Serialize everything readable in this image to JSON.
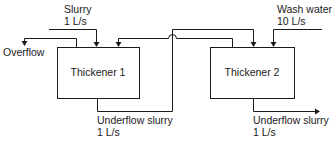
{
  "diagram": {
    "units": [
      {
        "id": "thickener-1",
        "label": "Thickener 1"
      },
      {
        "id": "thickener-2",
        "label": "Thickener 2"
      }
    ],
    "streams": {
      "slurry_feed": {
        "name": "Slurry",
        "rate": "1 L/s"
      },
      "overflow": {
        "name": "Overflow"
      },
      "underflow_1": {
        "name": "Underflow slurry",
        "rate": "1 L/s"
      },
      "wash_water": {
        "name": "Wash water",
        "rate": "10 L/s"
      },
      "underflow_2": {
        "name": "Underflow slurry",
        "rate": "1 L/s"
      }
    },
    "colors": {
      "line": "#1a1a1a",
      "background": "#ffffff"
    }
  }
}
